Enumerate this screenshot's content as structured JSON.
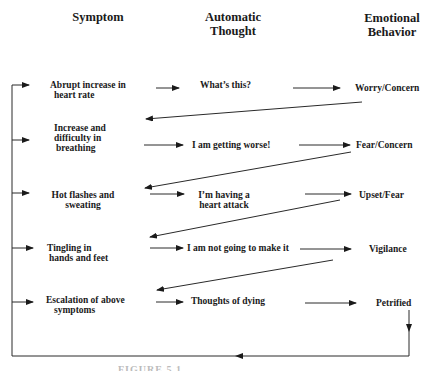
{
  "diagram": {
    "type": "flow-cycle",
    "columns": [
      {
        "id": "symptom",
        "title_lines": [
          "Symptom"
        ]
      },
      {
        "id": "thought",
        "title_lines": [
          "Automatic",
          "Thought"
        ]
      },
      {
        "id": "behavior",
        "title_lines": [
          "Emotional",
          "Behavior"
        ]
      }
    ],
    "rows": [
      {
        "symptom_lines": [
          "Abrupt increase in",
          " heart rate"
        ],
        "thought_lines": [
          "What’s this?"
        ],
        "behavior_lines": [
          "Worry/Concern"
        ]
      },
      {
        "symptom_lines": [
          "Increase and",
          "difficulty in",
          " breathing"
        ],
        "thought_lines": [
          "I am getting worse!"
        ],
        "behavior_lines": [
          "Fear/Concern"
        ]
      },
      {
        "symptom_lines": [
          "Hot flashes and",
          "sweating"
        ],
        "thought_lines": [
          "I’m having a",
          "heart attack"
        ],
        "behavior_lines": [
          "Upset/Fear"
        ]
      },
      {
        "symptom_lines": [
          "Tingling in",
          " hands and feet"
        ],
        "thought_lines": [
          "I am not going to make it"
        ],
        "behavior_lines": [
          "Vigilance"
        ]
      },
      {
        "symptom_lines": [
          "Escalation of above",
          "  symptoms"
        ],
        "thought_lines": [
          "Thoughts of  dying"
        ],
        "behavior_lines": [
          "Petrified"
        ]
      }
    ],
    "caption_partial": "FIGURE 5.1 ...",
    "colors": {
      "ink": "#1a1a1a",
      "background": "#ffffff"
    }
  }
}
